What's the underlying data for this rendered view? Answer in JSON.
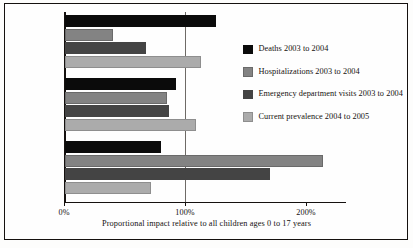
{
  "chart_data": {
    "type": "bar",
    "orientation": "horizontal",
    "grouped": true,
    "title": "",
    "xlabel": "Proportional impact relative to all children ages 0 to 17 years",
    "ylabel": "",
    "categories": [
      "11 to 17 years",
      "5 to 10 years",
      "0 to 4 years"
    ],
    "series": [
      {
        "name": "Deaths 2003 to 2004",
        "color": "#0b0b0b",
        "values": [
          125,
          92,
          79
        ]
      },
      {
        "name": "Hospitalizations 2003 to 2004",
        "color": "#838383",
        "values": [
          40,
          84,
          213
        ]
      },
      {
        "name": "Emergency department visits 2003 to 2004",
        "color": "#444444",
        "values": [
          67,
          86,
          169
        ]
      },
      {
        "name": "Current prevalence 2004 to 2005",
        "color": "#ababab",
        "values": [
          112,
          108,
          71
        ]
      }
    ],
    "xlim": [
      0,
      233
    ],
    "xticks": [
      0,
      100,
      200
    ],
    "xtick_labels": [
      "0%",
      "100%",
      "200%"
    ],
    "reference_line": 100,
    "grid": false,
    "legend_position": "right"
  },
  "legend": {
    "entries": [
      {
        "label": "Deaths 2003 to 2004"
      },
      {
        "label": "Hospitalizations 2003 to 2004"
      },
      {
        "label": "Emergency department visits 2003 to 2004"
      },
      {
        "label": "Current prevalence 2004 to 2005"
      }
    ]
  }
}
